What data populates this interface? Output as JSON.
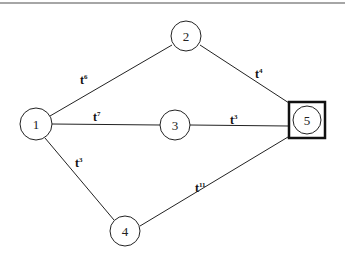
{
  "diagram": {
    "type": "network-graph",
    "nodes": [
      {
        "id": "1",
        "label": "1",
        "x": 36,
        "y": 124
      },
      {
        "id": "2",
        "label": "2",
        "x": 186,
        "y": 36
      },
      {
        "id": "3",
        "label": "3",
        "x": 175,
        "y": 124
      },
      {
        "id": "4",
        "label": "4",
        "x": 125,
        "y": 230
      },
      {
        "id": "5",
        "label": "5",
        "x": 306,
        "y": 120,
        "highlighted": true
      }
    ],
    "edges": [
      {
        "from": "1",
        "to": "2",
        "label": "t",
        "sup": "6"
      },
      {
        "from": "1",
        "to": "3",
        "label": "t",
        "sup": "7"
      },
      {
        "from": "1",
        "to": "4",
        "label": "t",
        "sup": "3"
      },
      {
        "from": "2",
        "to": "5",
        "label": "t",
        "sup": "4"
      },
      {
        "from": "3",
        "to": "5",
        "label": "t",
        "sup": "3"
      },
      {
        "from": "4",
        "to": "5",
        "label": "t",
        "sup": "11"
      }
    ]
  }
}
